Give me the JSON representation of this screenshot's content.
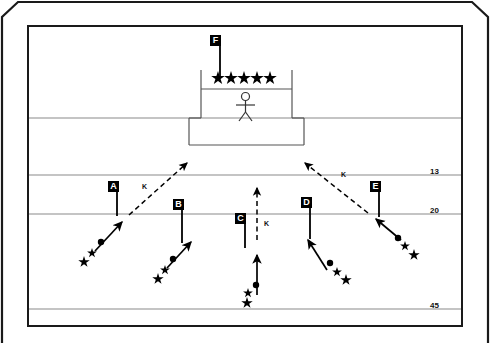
{
  "diagram": {
    "colors": {
      "ink": "#000000",
      "field_line": "#808080",
      "frame": "#1a1a1a",
      "background": "#ffffff",
      "label_fill": "#000000",
      "label_text": "#ffffff"
    },
    "frame": {
      "outer_name": "outer-border",
      "inner_name": "inner-border"
    },
    "stage": {
      "name": "podium",
      "star_count": 5,
      "star_glyph": "★",
      "figure_name": "stick-figure"
    },
    "row_labels": [
      {
        "text": "13",
        "x": 430,
        "y": 167
      },
      {
        "text": "20",
        "x": 430,
        "y": 206
      },
      {
        "text": "45",
        "x": 430,
        "y": 301
      }
    ],
    "field_lines": [
      {
        "name": "field-line-top",
        "y": 118
      },
      {
        "name": "field-line-13",
        "y": 175
      },
      {
        "name": "field-line-20",
        "y": 214
      },
      {
        "name": "field-line-45",
        "y": 309
      }
    ],
    "markers": [
      {
        "id": "A",
        "label": "A",
        "box_x": 108,
        "box_y": 181
      },
      {
        "id": "B",
        "label": "B",
        "box_x": 173,
        "box_y": 199
      },
      {
        "id": "C",
        "label": "C",
        "box_x": 235,
        "box_y": 213
      },
      {
        "id": "D",
        "label": "D",
        "box_x": 301,
        "box_y": 197
      },
      {
        "id": "E",
        "label": "E",
        "box_x": 370,
        "box_y": 181
      },
      {
        "id": "F",
        "label": "F",
        "box_x": 210,
        "box_y": 35
      }
    ],
    "k_labels": [
      {
        "text": "K",
        "x": 142,
        "y": 183
      },
      {
        "text": "K",
        "x": 264,
        "y": 220
      },
      {
        "text": "K",
        "x": 341,
        "y": 171
      }
    ],
    "squads": [
      {
        "name": "squad-a",
        "units": [
          "circle",
          "star",
          "star"
        ]
      },
      {
        "name": "squad-b",
        "units": [
          "circle",
          "star",
          "star"
        ]
      },
      {
        "name": "squad-c",
        "units": [
          "circle",
          "star",
          "star"
        ]
      },
      {
        "name": "squad-d",
        "units": [
          "circle",
          "star",
          "star"
        ]
      },
      {
        "name": "squad-e",
        "units": [
          "circle",
          "star",
          "star"
        ]
      }
    ],
    "arrows": {
      "solid_name": "movement-arrow",
      "dashed_name": "planned-path-arrow"
    }
  }
}
